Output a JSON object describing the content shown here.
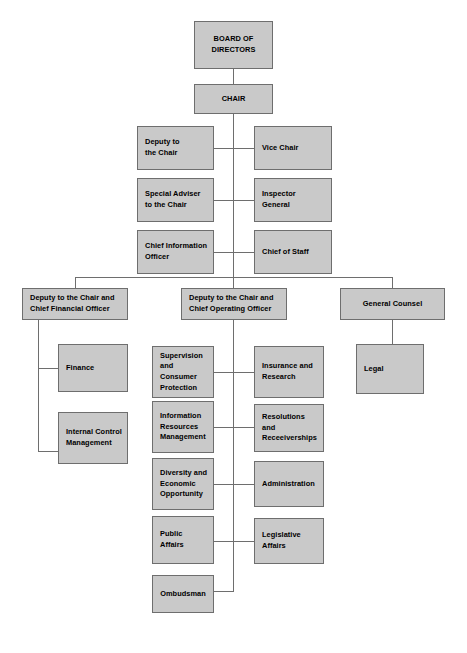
{
  "chart": {
    "type": "org-chart",
    "box_fill_color": "#c9c9c9",
    "box_border_color": "#6e6e6e",
    "connector_color": "#6e6e6e",
    "background_color": "#ffffff",
    "nodes": [
      {
        "id": "board",
        "label": "BOARD OF\nDIRECTORS",
        "level": 0,
        "align": "center"
      },
      {
        "id": "chair",
        "label": "CHAIR",
        "level": 1,
        "align": "center"
      },
      {
        "id": "deputy_chair",
        "label": "Deputy to\nthe Chair",
        "level": 2,
        "align": "left"
      },
      {
        "id": "vice_chair",
        "label": "Vice Chair",
        "level": 2,
        "align": "left"
      },
      {
        "id": "special_adv",
        "label": "Special Adviser\nto the Chair",
        "level": 2,
        "align": "left"
      },
      {
        "id": "inspector",
        "label": "Inspector\nGeneral",
        "level": 2,
        "align": "left"
      },
      {
        "id": "cio",
        "label": "Chief Information\nOfficer",
        "level": 2,
        "align": "left"
      },
      {
        "id": "chief_staff",
        "label": "Chief of Staff",
        "level": 2,
        "align": "left"
      },
      {
        "id": "cfo",
        "label": "Deputy to the Chair and\nChief Financial Officer",
        "level": 3,
        "align": "left"
      },
      {
        "id": "coo",
        "label": "Deputy to the Chair and\nChief Operating Officer",
        "level": 3,
        "align": "left"
      },
      {
        "id": "gc",
        "label": "General Counsel",
        "level": 3,
        "align": "center"
      },
      {
        "id": "finance",
        "label": "Finance",
        "level": 4,
        "align": "left"
      },
      {
        "id": "icm",
        "label": "Internal Control\nManagement",
        "level": 4,
        "align": "left"
      },
      {
        "id": "supervision",
        "label": "Supervision\nand Consumer\nProtection",
        "level": 4,
        "align": "left"
      },
      {
        "id": "insurance",
        "label": "Insurance and\nResearch",
        "level": 4,
        "align": "left"
      },
      {
        "id": "irm",
        "label": "Information\nResources\nManagement",
        "level": 4,
        "align": "left"
      },
      {
        "id": "resolutions",
        "label": "Resolutions and\nReceeiverships",
        "level": 4,
        "align": "left"
      },
      {
        "id": "diversity",
        "label": "Diversity and\nEconomic\nOpportunity",
        "level": 4,
        "align": "left"
      },
      {
        "id": "admin",
        "label": "Administration",
        "level": 4,
        "align": "left"
      },
      {
        "id": "public_aff",
        "label": "Public\nAffairs",
        "level": 4,
        "align": "left"
      },
      {
        "id": "legislative",
        "label": "Legislative\nAffairs",
        "level": 4,
        "align": "left"
      },
      {
        "id": "ombudsman",
        "label": "Ombudsman",
        "level": 4,
        "align": "center"
      },
      {
        "id": "legal",
        "label": "Legal",
        "level": 4,
        "align": "left"
      }
    ]
  }
}
